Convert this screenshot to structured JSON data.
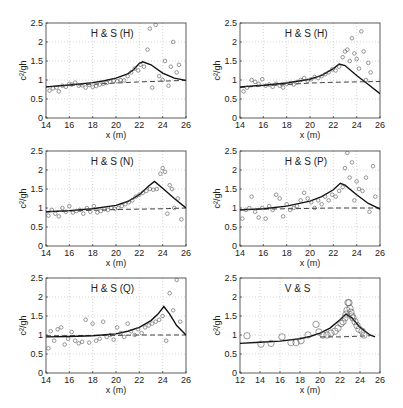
{
  "figure": {
    "ylabel": "c²/gh",
    "xlabel": "x (m)"
  },
  "chart_data": [
    {
      "type": "scatter",
      "title": "H & S (H)",
      "xlabel": "x (m)",
      "ylabel": "c²/gh",
      "xlim": [
        14,
        26
      ],
      "ylim": [
        0,
        2.5
      ],
      "xticks": [
        14,
        16,
        18,
        20,
        22,
        24,
        26
      ],
      "yticks": [
        0,
        0.5,
        1,
        1.5,
        2,
        2.5
      ],
      "grid": true,
      "box": {
        "left": 46,
        "right": 186,
        "top": 23,
        "bottom": 118
      },
      "series": [
        {
          "name": "model (solid)",
          "style": "solid",
          "x": [
            14,
            16,
            18,
            19,
            20,
            21,
            21.5,
            22,
            22.3,
            23,
            24,
            25,
            26
          ],
          "y": [
            0.82,
            0.87,
            0.93,
            0.98,
            1.05,
            1.16,
            1.27,
            1.44,
            1.48,
            1.4,
            1.18,
            1.05,
            0.99
          ]
        },
        {
          "name": "model (dashed)",
          "style": "dashed",
          "x": [
            14,
            16,
            18,
            20,
            22,
            24,
            26
          ],
          "y": [
            0.82,
            0.86,
            0.89,
            0.92,
            0.95,
            0.97,
            0.99
          ]
        },
        {
          "name": "observations",
          "style": "marker",
          "x": [
            14.3,
            14.6,
            14.9,
            15.1,
            15.4,
            15.7,
            16,
            16.2,
            16.5,
            16.8,
            17.1,
            17.4,
            17.7,
            18,
            18.3,
            18.6,
            18.9,
            19.2,
            19.5,
            19.8,
            20.1,
            20.4,
            20.7,
            21,
            21.3,
            21.6,
            21.9,
            22.1,
            22.4,
            22.7,
            22.9,
            23.1,
            23.4,
            23.7,
            24,
            24.2,
            24.5,
            24.7,
            24.9,
            25.2,
            25.4
          ],
          "y": [
            0.72,
            0.78,
            0.8,
            0.7,
            0.85,
            0.82,
            0.9,
            0.88,
            0.93,
            0.85,
            0.86,
            0.8,
            0.87,
            0.82,
            0.84,
            0.88,
            0.9,
            0.92,
            0.95,
            0.98,
            0.97,
            1.0,
            0.99,
            1.1,
            1.2,
            1.3,
            1.25,
            1.4,
            1.35,
            1.8,
            2.35,
            0.8,
            2.45,
            1.1,
            1.0,
            1.5,
            0.85,
            1.35,
            2.0,
            1.2,
            1.4
          ]
        }
      ]
    },
    {
      "type": "scatter",
      "title": "H & S (H)",
      "xlabel": "x (m)",
      "ylabel": "c²/gh",
      "xlim": [
        14,
        26
      ],
      "ylim": [
        0,
        2.5
      ],
      "xticks": [
        14,
        16,
        18,
        20,
        22,
        24,
        26
      ],
      "yticks": [
        0,
        0.5,
        1,
        1.5,
        2,
        2.5
      ],
      "grid": true,
      "box": {
        "left": 240,
        "right": 380,
        "top": 23,
        "bottom": 118
      },
      "series": [
        {
          "name": "model (solid)",
          "style": "solid",
          "x": [
            14,
            16,
            18,
            20,
            21,
            22,
            22.5,
            23,
            24,
            25,
            26
          ],
          "y": [
            0.82,
            0.86,
            0.92,
            1.02,
            1.12,
            1.3,
            1.42,
            1.38,
            1.12,
            0.88,
            0.64
          ]
        },
        {
          "name": "model (dashed)",
          "style": "dashed",
          "x": [
            14,
            16,
            18,
            20,
            22,
            24,
            26
          ],
          "y": [
            0.8,
            0.85,
            0.88,
            0.92,
            0.94,
            0.95,
            0.96
          ]
        },
        {
          "name": "observations",
          "style": "marker",
          "x": [
            14.3,
            14.6,
            15,
            15.3,
            15.6,
            15.9,
            16.2,
            16.5,
            16.8,
            17.1,
            17.4,
            17.7,
            18,
            18.3,
            18.6,
            18.9,
            19.2,
            19.5,
            19.8,
            20.1,
            20.4,
            20.7,
            21,
            21.3,
            21.6,
            21.9,
            22.2,
            22.5,
            22.8,
            23,
            23.2,
            23.4,
            23.6,
            23.8,
            24,
            24.2,
            24.4,
            24.6,
            24.8,
            25,
            25.2
          ],
          "y": [
            0.7,
            0.8,
            1.0,
            0.95,
            0.9,
            1.02,
            0.85,
            0.88,
            0.82,
            0.9,
            0.85,
            0.8,
            0.9,
            0.92,
            0.88,
            0.95,
            1.0,
            1.05,
            0.98,
            1.02,
            1.08,
            1.05,
            1.1,
            1.15,
            1.2,
            1.28,
            1.25,
            1.35,
            1.6,
            1.75,
            1.8,
            1.5,
            2.1,
            1.7,
            1.55,
            1.3,
            2.28,
            1.75,
            1.0,
            1.45,
            1.2
          ]
        }
      ]
    },
    {
      "type": "scatter",
      "title": "H & S (N)",
      "xlabel": "x (m)",
      "ylabel": "c²/gh",
      "xlim": [
        14,
        26
      ],
      "ylim": [
        0,
        2.5
      ],
      "xticks": [
        14,
        16,
        18,
        20,
        22,
        24,
        26
      ],
      "yticks": [
        0,
        0.5,
        1,
        1.5,
        2,
        2.5
      ],
      "grid": true,
      "box": {
        "left": 46,
        "right": 186,
        "top": 151,
        "bottom": 246
      },
      "series": [
        {
          "name": "model (solid)",
          "style": "solid",
          "x": [
            14,
            16,
            18,
            20,
            21,
            22,
            22.8,
            23.3,
            24,
            25,
            26
          ],
          "y": [
            0.9,
            0.93,
            0.98,
            1.07,
            1.17,
            1.35,
            1.58,
            1.7,
            1.52,
            1.25,
            1.0
          ]
        },
        {
          "name": "model (dashed)",
          "style": "dashed",
          "x": [
            14,
            16,
            18,
            20,
            22,
            24,
            26
          ],
          "y": [
            0.9,
            0.92,
            0.94,
            0.96,
            0.97,
            0.98,
            1.0
          ]
        },
        {
          "name": "observations",
          "style": "marker",
          "x": [
            14.2,
            14.5,
            14.8,
            15.1,
            15.4,
            15.7,
            16,
            16.3,
            16.6,
            16.9,
            17.2,
            17.5,
            17.8,
            18.1,
            18.4,
            18.7,
            19,
            19.3,
            19.6,
            19.9,
            20.2,
            20.5,
            20.8,
            21.1,
            21.4,
            21.7,
            22,
            22.3,
            22.6,
            22.9,
            23.2,
            23.5,
            23.8,
            24,
            24.2,
            24.4,
            24.6,
            24.8,
            25,
            25.3,
            25.6
          ],
          "y": [
            0.8,
            0.95,
            0.85,
            0.78,
            1.0,
            0.9,
            1.05,
            0.88,
            0.92,
            0.95,
            0.85,
            1.0,
            0.9,
            1.05,
            0.88,
            0.92,
            0.97,
            0.95,
            1.0,
            0.98,
            1.0,
            1.05,
            1.1,
            1.15,
            1.2,
            1.3,
            1.35,
            1.4,
            1.45,
            1.5,
            1.48,
            1.5,
            1.9,
            2.05,
            1.95,
            0.85,
            1.6,
            1.5,
            1.0,
            1.25,
            0.7
          ]
        }
      ]
    },
    {
      "type": "scatter",
      "title": "H & S (P)",
      "xlabel": "x (m)",
      "ylabel": "c²/gh",
      "xlim": [
        14,
        26
      ],
      "ylim": [
        0,
        2.5
      ],
      "xticks": [
        14,
        16,
        18,
        20,
        22,
        24,
        26
      ],
      "yticks": [
        0,
        0.5,
        1,
        1.5,
        2,
        2.5
      ],
      "grid": true,
      "box": {
        "left": 240,
        "right": 380,
        "top": 151,
        "bottom": 246
      },
      "series": [
        {
          "name": "model (solid)",
          "style": "solid",
          "x": [
            14,
            16,
            18,
            20,
            21,
            22,
            22.6,
            23,
            24,
            25,
            26
          ],
          "y": [
            0.95,
            0.98,
            1.05,
            1.18,
            1.3,
            1.48,
            1.65,
            1.6,
            1.35,
            1.12,
            0.97
          ]
        },
        {
          "name": "model (dashed)",
          "style": "dashed",
          "x": [
            14,
            16,
            18,
            20,
            22,
            24,
            26
          ],
          "y": [
            0.95,
            0.97,
            0.98,
            0.99,
            1.0,
            1.0,
            1.0
          ]
        },
        {
          "name": "observations",
          "style": "marker",
          "x": [
            14.2,
            14.5,
            14.8,
            15.0,
            15.3,
            15.6,
            15.9,
            16.2,
            16.5,
            16.8,
            17.1,
            17.4,
            17.7,
            18,
            18.3,
            18.6,
            18.9,
            19.2,
            19.5,
            19.8,
            20.1,
            20.4,
            20.7,
            21,
            21.3,
            21.6,
            21.9,
            22.2,
            22.5,
            22.8,
            23,
            23.2,
            23.4,
            23.6,
            23.8,
            24,
            24.2,
            24.5,
            24.8,
            25.1,
            25.4,
            25.6
          ],
          "y": [
            0.72,
            0.95,
            1.0,
            1.3,
            0.9,
            0.75,
            1.0,
            0.72,
            1.05,
            0.95,
            1.35,
            1.25,
            0.78,
            1.1,
            0.95,
            1.0,
            1.05,
            1.2,
            1.4,
            1.25,
            1.15,
            1.0,
            1.2,
            1.1,
            1.3,
            1.2,
            1.35,
            1.3,
            1.45,
            1.55,
            2.05,
            2.45,
            1.8,
            2.2,
            1.2,
            1.7,
            1.5,
            1.45,
            1.8,
            0.9,
            2.1,
            1.3
          ]
        }
      ]
    },
    {
      "type": "scatter",
      "title": "H & S (Q)",
      "xlabel": "x (m)",
      "ylabel": "c²/gh",
      "xlim": [
        14,
        26
      ],
      "ylim": [
        0,
        2.5
      ],
      "xticks": [
        14,
        16,
        18,
        20,
        22,
        24,
        26
      ],
      "yticks": [
        0,
        0.5,
        1,
        1.5,
        2,
        2.5
      ],
      "grid": true,
      "box": {
        "left": 46,
        "right": 186,
        "top": 278,
        "bottom": 373
      },
      "series": [
        {
          "name": "model (solid)",
          "style": "solid",
          "x": [
            14,
            16,
            18,
            20,
            21,
            22,
            23,
            23.6,
            24.1,
            24.6,
            25.2,
            26
          ],
          "y": [
            0.95,
            0.96,
            0.98,
            1.03,
            1.1,
            1.2,
            1.38,
            1.55,
            1.75,
            1.55,
            1.25,
            1.0
          ]
        },
        {
          "name": "model (dashed)",
          "style": "dashed",
          "x": [
            14,
            16,
            18,
            20,
            22,
            24,
            26
          ],
          "y": [
            0.98,
            0.98,
            0.99,
            0.99,
            1.0,
            1.0,
            1.0
          ]
        },
        {
          "name": "observations",
          "style": "marker",
          "x": [
            14.2,
            14.4,
            14.7,
            15,
            15.3,
            15.6,
            15.9,
            16.2,
            16.5,
            16.8,
            17.1,
            17.4,
            17.7,
            18,
            18.3,
            18.6,
            18.9,
            19.2,
            19.5,
            19.8,
            20.1,
            20.4,
            20.7,
            21,
            21.3,
            21.6,
            21.9,
            22.2,
            22.5,
            22.8,
            23.1,
            23.4,
            23.7,
            24,
            24.3,
            24.6,
            24.9,
            25.2,
            25.5
          ],
          "y": [
            0.65,
            1.1,
            0.85,
            1.15,
            1.2,
            0.75,
            0.9,
            1.08,
            0.85,
            0.78,
            0.82,
            1.4,
            0.8,
            1.3,
            0.85,
            0.9,
            1.35,
            0.95,
            1.0,
            0.88,
            1.2,
            1.05,
            0.95,
            1.3,
            1.1,
            1.0,
            1.15,
            1.05,
            1.2,
            1.25,
            1.3,
            1.35,
            1.4,
            1.5,
            0.85,
            2.1,
            1.65,
            2.45,
            1.35
          ]
        }
      ]
    },
    {
      "type": "scatter",
      "title": "V & S",
      "xlabel": "x (m)",
      "ylabel": "c²/gh",
      "xlim": [
        12,
        26
      ],
      "ylim": [
        0,
        2.5
      ],
      "xticks": [
        12,
        14,
        16,
        18,
        20,
        22,
        24,
        26
      ],
      "yticks": [
        0,
        0.5,
        1,
        1.5,
        2,
        2.5
      ],
      "grid": true,
      "box": {
        "left": 240,
        "right": 380,
        "top": 278,
        "bottom": 373
      },
      "series": [
        {
          "name": "model (solid)",
          "style": "solid",
          "x": [
            12,
            14,
            16,
            18,
            19,
            20,
            21,
            22,
            22.6,
            23.2,
            24,
            25,
            25.5
          ],
          "y": [
            0.78,
            0.81,
            0.84,
            0.9,
            0.96,
            1.05,
            1.18,
            1.4,
            1.55,
            1.45,
            1.2,
            1.0,
            0.95
          ]
        },
        {
          "name": "model (dashed)",
          "style": "dashed",
          "x": [
            20,
            21,
            22,
            23,
            24,
            25
          ],
          "y": [
            0.95,
            0.95,
            0.95,
            0.96,
            0.97,
            0.98
          ]
        },
        {
          "name": "observations",
          "style": "circle",
          "x": [
            12.7,
            14.1,
            15.1,
            16.2,
            17.1,
            17.6,
            18.1,
            18.8,
            19.6,
            19.9,
            20.3,
            20.7,
            21.1,
            21.5,
            21.8,
            22.1,
            22.3,
            22.5,
            22.6,
            22.7,
            22.8,
            22.9,
            23.0,
            23.1,
            23.2,
            23.3,
            23.5,
            23.7,
            23.9,
            24.2,
            24.4
          ],
          "y": [
            0.98,
            0.76,
            0.78,
            0.95,
            0.8,
            0.8,
            0.85,
            1.0,
            1.28,
            1.08,
            1.0,
            1.0,
            1.05,
            1.1,
            1.18,
            1.3,
            1.35,
            1.45,
            1.55,
            1.65,
            1.85,
            1.85,
            1.7,
            1.6,
            1.5,
            1.45,
            1.35,
            1.25,
            1.15,
            1.1,
            1.0
          ]
        }
      ]
    }
  ]
}
